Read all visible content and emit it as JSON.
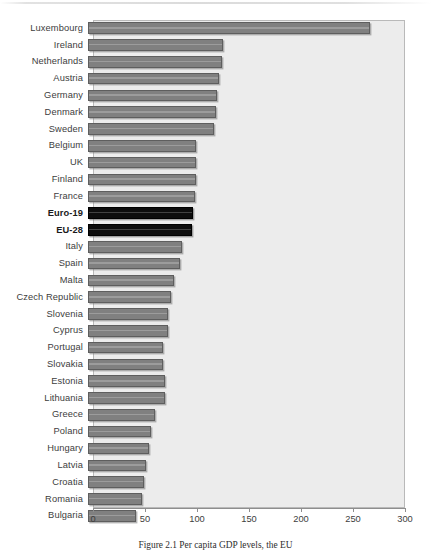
{
  "caption": "Figure 2.1  Per capita GDP levels, the EU",
  "colors": {
    "bar_fill": "#808080",
    "bar_border": "#5e5e5e",
    "highlight_fill": "#0d0d0d",
    "plot_background": "#ececec",
    "axis": "#8e8e8e",
    "label_text": "#3d3d3d"
  },
  "chart_data": {
    "type": "bar",
    "orientation": "horizontal",
    "title": "",
    "xlabel": "",
    "ylabel": "",
    "xlim": [
      0,
      300
    ],
    "xticks": [
      0,
      50,
      100,
      150,
      200,
      250,
      300
    ],
    "grid": false,
    "legend": "none",
    "highlight_categories": [
      "Euro-19",
      "EU-28"
    ],
    "categories": [
      "Luxembourg",
      "Ireland",
      "Netherlands",
      "Austria",
      "Germany",
      "Denmark",
      "Sweden",
      "Belgium",
      "UK",
      "Finland",
      "France",
      "Euro-19",
      "EU-28",
      "Italy",
      "Spain",
      "Malta",
      "Czech Republic",
      "Slovenia",
      "Cyprus",
      "Portugal",
      "Slovakia",
      "Estonia",
      "Lithuania",
      "Greece",
      "Poland",
      "Hungary",
      "Latvia",
      "Croatia",
      "Romania",
      "Bulgaria"
    ],
    "values": [
      271,
      130,
      129,
      126,
      124,
      123,
      121,
      104,
      104,
      104,
      103,
      101,
      100,
      90,
      88,
      83,
      80,
      77,
      77,
      72,
      72,
      74,
      74,
      64,
      61,
      59,
      56,
      54,
      52,
      46
    ]
  }
}
